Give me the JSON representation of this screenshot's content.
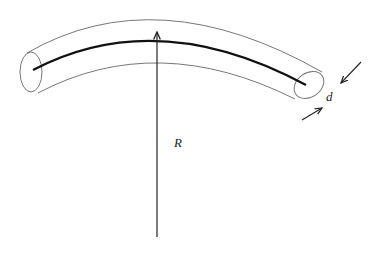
{
  "diagram": {
    "labels": {
      "radius": "R",
      "diameter": "d"
    },
    "colors": {
      "tube_outline": "#777777",
      "centerline": "#111111",
      "arrow": "#222222",
      "background": "#ffffff"
    },
    "elements": [
      {
        "name": "tube-outline",
        "description": "curved cylindrical tube outline"
      },
      {
        "name": "centerline",
        "description": "thick curved centerline of tube"
      },
      {
        "name": "radius-arrow",
        "description": "vertical arrow indicating radius R pointing to centerline"
      },
      {
        "name": "diameter-arrows",
        "description": "pair of opposing arrows indicating diameter d at right end"
      }
    ]
  }
}
